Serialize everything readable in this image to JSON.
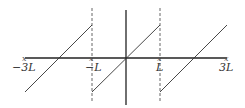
{
  "diagram": {
    "title": "",
    "type": "sawtooth-periodic-extension",
    "labels": {
      "neg3L": "−3L",
      "negL": "−L",
      "L": "L",
      "pos3L": "3L"
    },
    "markers": {
      "left_end": "x",
      "negL": "x",
      "L": "x",
      "right_end": "x"
    },
    "colors": {
      "axis": "#222222",
      "curve": "#333333",
      "dashed": "#555555",
      "label": "#333333"
    }
  }
}
